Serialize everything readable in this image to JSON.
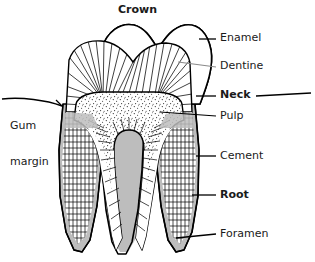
{
  "figure": {
    "title": "Crown",
    "background_color": "#ffffff",
    "ink_color": "#000000",
    "cement_color": "#bdbdbd",
    "leader_color": "#7a7a7a"
  },
  "labels": {
    "crown": "Crown",
    "enamel": "Enamel",
    "dentine": "Dentine",
    "neck": "Neck",
    "pulp": "Pulp",
    "cement": "Cement",
    "root": "Root",
    "foramen": "Foramen",
    "gum_margin_line1": "Gum",
    "gum_margin_line2": "margin"
  },
  "structures": [
    {
      "name": "enamel",
      "label": "Enamel",
      "fill": "white",
      "bold": false
    },
    {
      "name": "dentine",
      "label": "Dentine",
      "fill": "hatched",
      "bold": false
    },
    {
      "name": "neck",
      "label": "Neck",
      "fill": "none",
      "bold": true
    },
    {
      "name": "pulp",
      "label": "Pulp",
      "fill": "stippled",
      "bold": false
    },
    {
      "name": "cement",
      "label": "Cement",
      "fill": "grey",
      "bold": false
    },
    {
      "name": "root",
      "label": "Root",
      "fill": "none",
      "bold": true
    },
    {
      "name": "foramen",
      "label": "Foramen",
      "fill": "none",
      "bold": false
    },
    {
      "name": "gum-margin",
      "label": "Gum margin",
      "fill": "none",
      "bold": false
    },
    {
      "name": "crown",
      "label": "Crown",
      "fill": "none",
      "bold": true
    }
  ]
}
